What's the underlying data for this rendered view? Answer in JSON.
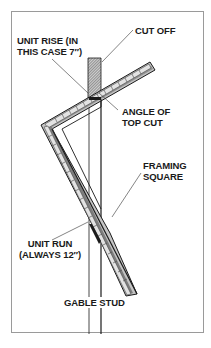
{
  "diagram": {
    "labels": {
      "cut_off": "CUT OFF",
      "unit_rise_line1": "UNIT RISE (IN",
      "unit_rise_line2": "THIS CASE 7″)",
      "angle_line1": "ANGLE OF",
      "angle_line2": "TOP CUT",
      "framing_line1": "FRAMING",
      "framing_line2": "SQUARE",
      "unit_run_line1": "UNIT RUN",
      "unit_run_line2": "(ALWAYS 12″)",
      "gable_stud": "GABLE STUD"
    },
    "values": {
      "unit_rise_inches": 7,
      "unit_run_inches": 12
    },
    "colors": {
      "line": "#1a1a1a",
      "frame": "#9a9a9a",
      "square_fill": "#bdbdbd",
      "hatch": "#555555"
    }
  }
}
